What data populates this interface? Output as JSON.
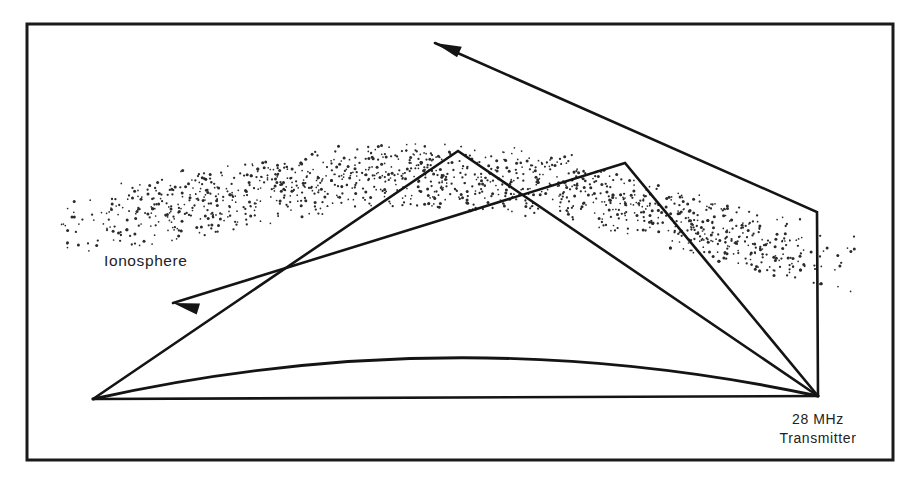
{
  "diagram": {
    "frame": {
      "x": 27,
      "y": 24,
      "width": 866,
      "height": 436,
      "stroke": "#1a1a1a",
      "background": "#ffffff"
    },
    "labels": {
      "ionosphere": "Ionosphere",
      "transmitter_line1": "28 MHz",
      "transmitter_line2": "Transmitter"
    },
    "label_positions": {
      "ionosphere": {
        "x": 104,
        "y": 266
      },
      "transmitter": {
        "x": 818,
        "y": 424
      }
    },
    "colors": {
      "ink": "#141414",
      "frame": "#1a1a1a",
      "stipple": "#2b2b2b",
      "paper": "#ffffff"
    },
    "ionosphere_band": {
      "description": "stippled layer sloping downward to the right",
      "top_edge": [
        [
          58,
          196
        ],
        [
          200,
          168
        ],
        [
          380,
          140
        ],
        [
          560,
          152
        ],
        [
          700,
          196
        ],
        [
          855,
          232
        ]
      ],
      "bottom_edge": [
        [
          58,
          262
        ],
        [
          200,
          236
        ],
        [
          380,
          206
        ],
        [
          560,
          218
        ],
        [
          700,
          258
        ],
        [
          855,
          296
        ]
      ],
      "dot_count": 2100
    },
    "earth_curve": {
      "description": "curved earth surface",
      "start": [
        93,
        399
      ],
      "control": [
        455,
        318
      ],
      "end": [
        818,
        396
      ]
    },
    "transmitter_point": [
      818,
      396
    ],
    "ray_paths": [
      {
        "name": "vertical-ray-refracted-escape",
        "points": [
          [
            818,
            396
          ],
          [
            817,
            212
          ],
          [
            435,
            43
          ]
        ],
        "arrow_at_end": true
      },
      {
        "name": "hop-path-high-angle",
        "points": [
          [
            818,
            396
          ],
          [
            625,
            163
          ],
          [
            173,
            303
          ]
        ],
        "arrow_at_end": true
      },
      {
        "name": "hop-path-low-angle",
        "points": [
          [
            818,
            396
          ],
          [
            458,
            151
          ],
          [
            93,
            399
          ]
        ],
        "arrow_at_end": false
      },
      {
        "name": "ground-ray-direct",
        "points": [
          [
            818,
            396
          ],
          [
            93,
            399
          ]
        ],
        "arrow_at_end": false
      }
    ],
    "arrowheads": [
      {
        "name": "upper-left-arrowhead",
        "tip": [
          435,
          43
        ],
        "angle_deg": 204
      },
      {
        "name": "mid-left-arrowhead",
        "tip": [
          173,
          303
        ],
        "angle_deg": 197
      }
    ]
  }
}
